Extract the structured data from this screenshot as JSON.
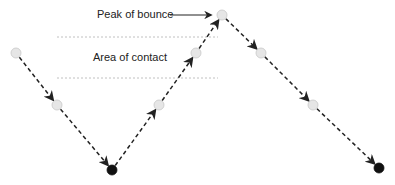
{
  "labels": {
    "peak": "Peak of bounce",
    "contact": "Area of contact"
  },
  "colors": {
    "path": "#222222",
    "ball_light": "#e6e6e6",
    "ball_light_stroke": "#c8c8c8",
    "ball_dark": "#111111",
    "guide": "#b0b0b0"
  },
  "points": [
    {
      "x": 16,
      "y": 53,
      "type": "light"
    },
    {
      "x": 57,
      "y": 105,
      "type": "light"
    },
    {
      "x": 112,
      "y": 170,
      "type": "dark"
    },
    {
      "x": 159,
      "y": 105,
      "type": "light"
    },
    {
      "x": 196,
      "y": 53,
      "type": "light"
    },
    {
      "x": 222,
      "y": 15,
      "type": "light"
    },
    {
      "x": 261,
      "y": 53,
      "type": "light"
    },
    {
      "x": 313,
      "y": 105,
      "type": "light"
    },
    {
      "x": 379,
      "y": 168,
      "type": "dark"
    }
  ]
}
